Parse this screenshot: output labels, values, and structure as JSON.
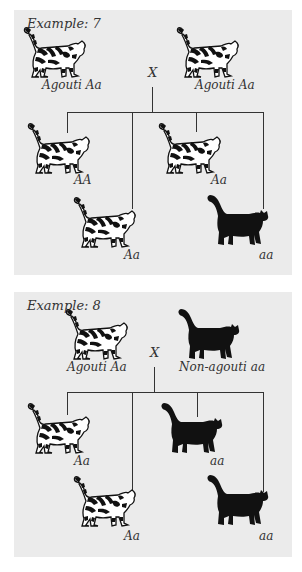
{
  "examples": [
    {
      "title": "Example: 7",
      "cross_symbol": "X",
      "parents": [
        {
          "phenotype": "Agouti",
          "genotype": "Aa",
          "label": "Agouti  Aa",
          "cat_type": "tabby-cat-icon"
        },
        {
          "phenotype": "Agouti",
          "genotype": "Aa",
          "label": "Agouti  Aa",
          "cat_type": "tabby-cat-icon"
        }
      ],
      "offspring": [
        {
          "genotype": "AA",
          "label": "AA",
          "cat_type": "tabby-cat-icon"
        },
        {
          "genotype": "Aa",
          "label": "Aa",
          "cat_type": "tabby-cat-icon"
        },
        {
          "genotype": "Aa",
          "label": "Aa",
          "cat_type": "tabby-cat-icon"
        },
        {
          "genotype": "aa",
          "label": "aa",
          "cat_type": "black-cat-icon"
        }
      ]
    },
    {
      "title": "Example: 8",
      "cross_symbol": "X",
      "parents": [
        {
          "phenotype": "Agouti",
          "genotype": "Aa",
          "label": "Agouti  Aa",
          "cat_type": "tabby-cat-icon"
        },
        {
          "phenotype": "Non-agouti",
          "genotype": "aa",
          "label": "Non-agouti  aa",
          "cat_type": "black-cat-icon"
        }
      ],
      "offspring": [
        {
          "genotype": "Aa",
          "label": "Aa",
          "cat_type": "tabby-cat-icon"
        },
        {
          "genotype": "aa",
          "label": "aa",
          "cat_type": "black-cat-icon"
        },
        {
          "genotype": "Aa",
          "label": "Aa",
          "cat_type": "tabby-cat-icon"
        },
        {
          "genotype": "aa",
          "label": "aa",
          "cat_type": "black-cat-icon"
        }
      ]
    }
  ],
  "colors": {
    "panel_bg": "#ebebeb",
    "ink": "#111111",
    "line": "#333333"
  }
}
